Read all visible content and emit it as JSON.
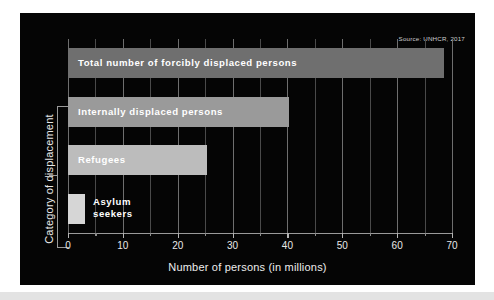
{
  "figure": {
    "source_note": "Source: UNHCR, 2017",
    "background_color": "#050505",
    "page_color": "#ffffff",
    "strip_color": "#e3e3e3"
  },
  "chart_data": {
    "type": "bar",
    "orientation": "horizontal",
    "title": "",
    "subtitle": "",
    "xlabel": "Number of persons (in millions)",
    "ylabel": "Category of displacement",
    "xlim": [
      0,
      70
    ],
    "ylim": [
      0,
      4
    ],
    "grid": true,
    "grid_axis": "x",
    "legend": "none",
    "source": "Source: UNHCR, 2017",
    "categories": [
      "Asylum seekers",
      "Refugees",
      "Internally displaced persons",
      "Total number of forcibly displaced persons"
    ],
    "values": [
      3.1,
      25.4,
      40.3,
      68.5
    ],
    "units": "millions of persons",
    "major_ticks": [
      0,
      10,
      20,
      30,
      40,
      50,
      60,
      70
    ],
    "minor_ticks": [
      5,
      15,
      25,
      35,
      45,
      55,
      65
    ],
    "tick_labels": [
      "0",
      "10",
      "20",
      "30",
      "40",
      "50",
      "60",
      "70"
    ],
    "bars": [
      {
        "label": "Total number of forcibly displaced persons",
        "label_display": "Total number of forcibly displaced persons",
        "value": 68.5,
        "color": "#6f6f6f",
        "label_inside": true,
        "row": 0
      },
      {
        "label": "Internally displaced persons",
        "label_display": "Internally displaced persons",
        "value": 40.3,
        "color": "#9a9a9a",
        "label_inside": true,
        "row": 1
      },
      {
        "label": "Refugees",
        "label_display": "Refugees",
        "value": 25.4,
        "color": "#bcbcbc",
        "label_inside": true,
        "row": 2
      },
      {
        "label": "Asylum seekers",
        "label_display": "Asylum\nseekers",
        "value": 3.1,
        "color": "#d6d6d6",
        "label_inside": false,
        "row": 3
      }
    ]
  }
}
